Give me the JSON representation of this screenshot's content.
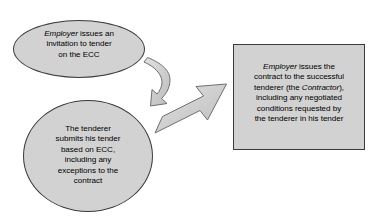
{
  "diagram": {
    "background_color": "#ffffff",
    "shape_fill_color": "#d2d2d2",
    "shape_border_color": "#3a3a3a",
    "text_color": "#000000",
    "arrow_fill_color": "#cccccc",
    "arrow_border_color": "#6b6b6b",
    "nodes": [
      {
        "id": "invitation-to-tender",
        "shape": "ellipse",
        "text": "Employer issues an invitation to tender on the ECC",
        "line_1_italic": "Employer",
        "line_1_rest": " issues an",
        "line_2": "invitation to tender",
        "line_3": "on the ECC"
      },
      {
        "id": "tenderer-submits-tender",
        "shape": "circle",
        "text": "The tenderer submits his tender based on ECC, including any exceptions to the contract",
        "line_1": "The tenderer",
        "line_2": "submits his tender",
        "line_3": "based on ECC,",
        "line_4": "including any",
        "line_5": "exceptions to the",
        "line_6": "contract"
      },
      {
        "id": "employer-issues-contract",
        "shape": "rectangle",
        "text": "Employer issues the contract to the successful tenderer (the Contractor), including any negotiated conditions requested by the tenderer in his tender",
        "line_1_italic": "Employer",
        "line_1_rest": " issues the",
        "line_2": "contract to the successful",
        "line_3_pre": "tenderer (the ",
        "line_3_italic": "Contractor",
        "line_3_post": "),",
        "line_4": "including any negotiated",
        "line_5": "conditions requested by",
        "line_6": "the tenderer in his tender"
      }
    ],
    "arrows": [
      {
        "id": "curved-arrow-down",
        "style": "curved",
        "from": "invitation-to-tender",
        "to": "tenderer-submits-tender",
        "direction": "down"
      },
      {
        "id": "straight-arrow-up-right",
        "style": "straight",
        "from": "tenderer-submits-tender",
        "to": "employer-issues-contract",
        "direction": "up-right"
      }
    ]
  }
}
